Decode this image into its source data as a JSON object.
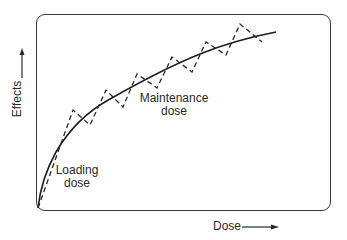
{
  "diagram": {
    "type": "pharmacology dose-effect curve",
    "axes": {
      "x_label": "Dose",
      "y_label": "Effects",
      "x_arrow_icon": "arrow-right",
      "y_arrow_icon": "arrow-up"
    },
    "annotations": {
      "loading_line1": "Loading",
      "loading_line2": "dose",
      "maintenance_line1": "Maintenance",
      "maintenance_line2": "dose"
    },
    "curves": {
      "solid": {
        "name": "steady effect curve",
        "style": "solid",
        "color": "#1e1e1e"
      },
      "dashed": {
        "name": "dose fluctuation sawtooth",
        "style": "dashed",
        "color": "#2a2a2a",
        "peaks": 6
      }
    },
    "colors": {
      "line": "#1e1e1e",
      "frame": "#3a3a3a",
      "text": "#2a2a2a",
      "background": "#ffffff"
    }
  }
}
